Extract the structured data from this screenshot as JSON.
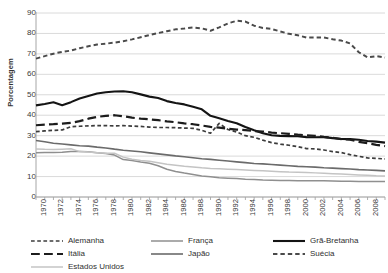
{
  "chart_data": {
    "type": "line",
    "title": "",
    "xlabel": "",
    "ylabel": "Porcentagem",
    "ylim": [
      0,
      90
    ],
    "ytick_step": 10,
    "yticks": [
      0,
      10,
      20,
      30,
      40,
      50,
      60,
      70,
      80,
      90
    ],
    "xlim": [
      1970,
      2010
    ],
    "x": [
      1970,
      1971,
      1972,
      1973,
      1974,
      1975,
      1976,
      1977,
      1978,
      1979,
      1980,
      1981,
      1982,
      1983,
      1984,
      1985,
      1986,
      1987,
      1988,
      1989,
      1990,
      1991,
      1992,
      1993,
      1994,
      1995,
      1996,
      1997,
      1998,
      1999,
      2000,
      2001,
      2002,
      2003,
      2004,
      2005,
      2006,
      2007,
      2008,
      2009,
      2010
    ],
    "xtick_labels": [
      "1970",
      "1972",
      "1974",
      "1976",
      "1978",
      "1980",
      "1982",
      "1984",
      "1986",
      "1988",
      "1990",
      "1992",
      "1994",
      "1996",
      "1998",
      "2000",
      "2002",
      "2004",
      "2006",
      "2008",
      "2010"
    ],
    "grid": "horizontal",
    "legend_position": "bottom",
    "series": [
      {
        "name": "Alemanha",
        "color": "#3c3c3c",
        "style": "dashed",
        "width": 1.7,
        "values": [
          32.0,
          32.3,
          32.6,
          32.8,
          34.4,
          34.6,
          34.8,
          34.9,
          34.9,
          34.8,
          34.9,
          34.7,
          34.5,
          34.2,
          34.0,
          34.0,
          33.9,
          33.7,
          33.6,
          32.6,
          31.2,
          36.0,
          33.0,
          31.8,
          30.0,
          29.2,
          27.8,
          26.6,
          25.9,
          25.3,
          24.6,
          23.7,
          23.5,
          23.0,
          22.2,
          21.7,
          20.7,
          19.9,
          19.1,
          18.9,
          18.6
        ]
      },
      {
        "name": "França",
        "color": "#8f8f8f",
        "style": "solid",
        "width": 1.5,
        "values": [
          21.7,
          21.8,
          21.8,
          21.9,
          22.2,
          22.2,
          22.1,
          21.7,
          21.3,
          20.5,
          18.3,
          17.8,
          17.1,
          16.5,
          15.3,
          13.6,
          12.5,
          11.7,
          11.0,
          10.3,
          9.9,
          9.4,
          9.2,
          9.0,
          8.7,
          8.5,
          8.3,
          8.2,
          8.1,
          8.1,
          8.0,
          8.0,
          8.0,
          7.9,
          7.8,
          7.7,
          7.7,
          7.6,
          7.6,
          7.6,
          7.6
        ]
      },
      {
        "name": "Grã-Bretanha",
        "color": "#141414",
        "style": "solid",
        "width": 2.1,
        "values": [
          44.8,
          45.5,
          46.3,
          44.9,
          46.4,
          48.2,
          49.4,
          50.6,
          51.2,
          51.6,
          51.7,
          51.2,
          50.2,
          49.1,
          48.4,
          46.9,
          46.0,
          45.3,
          44.1,
          42.9,
          39.7,
          38.5,
          37.2,
          36.1,
          34.2,
          32.6,
          31.2,
          30.2,
          29.9,
          29.8,
          29.7,
          29.3,
          29.2,
          29.3,
          28.8,
          28.4,
          28.3,
          28.0,
          27.4,
          27.1,
          26.6
        ]
      },
      {
        "name": "Itália",
        "color": "#1c1c1c",
        "style": "long-dash",
        "width": 2.2,
        "values": [
          35.1,
          35.4,
          35.6,
          35.9,
          36.3,
          37.1,
          38.3,
          39.2,
          39.7,
          40.0,
          39.5,
          38.8,
          38.3,
          38.0,
          37.6,
          37.0,
          36.6,
          36.0,
          35.6,
          35.0,
          34.3,
          33.9,
          33.4,
          33.0,
          32.7,
          32.3,
          32.0,
          31.5,
          31.2,
          30.9,
          30.5,
          30.2,
          29.9,
          29.4,
          29.0,
          28.3,
          28.0,
          27.0,
          26.3,
          25.5,
          24.9
        ]
      },
      {
        "name": "Japão",
        "color": "#6b6b6b",
        "style": "solid",
        "width": 1.6,
        "values": [
          27.6,
          27.0,
          26.3,
          25.9,
          25.5,
          25.1,
          24.9,
          24.4,
          24.0,
          23.4,
          22.9,
          22.5,
          22.1,
          21.6,
          21.1,
          20.6,
          20.1,
          19.7,
          19.2,
          18.7,
          18.4,
          18.0,
          17.6,
          17.2,
          16.8,
          16.4,
          16.2,
          15.9,
          15.6,
          15.3,
          15.0,
          14.8,
          14.6,
          14.3,
          14.1,
          13.9,
          13.7,
          13.4,
          13.2,
          13.0,
          12.8
        ]
      },
      {
        "name": "Estados Unidos",
        "color": "#c4c4c4",
        "style": "solid",
        "width": 1.5,
        "values": [
          23.5,
          23.3,
          23.2,
          23.4,
          23.6,
          22.2,
          22.0,
          21.7,
          21.4,
          21.4,
          19.5,
          18.5,
          17.9,
          17.5,
          16.8,
          16.0,
          15.5,
          15.0,
          14.7,
          14.3,
          14.0,
          13.8,
          13.6,
          13.4,
          13.2,
          13.0,
          12.8,
          12.6,
          12.4,
          12.2,
          12.1,
          12.0,
          11.8,
          11.6,
          11.4,
          11.2,
          11.0,
          10.8,
          10.6,
          10.4,
          10.3
        ]
      },
      {
        "name": "Suécia",
        "color": "#4a4a4a",
        "style": "dashed",
        "width": 2.0,
        "values": [
          67.7,
          68.9,
          70.1,
          71.0,
          71.6,
          72.8,
          73.7,
          74.6,
          75.0,
          75.5,
          76.2,
          77.1,
          78.1,
          79.2,
          80.2,
          81.1,
          82.0,
          82.4,
          82.9,
          82.5,
          81.3,
          83.0,
          84.9,
          86.2,
          85.8,
          83.8,
          82.7,
          82.2,
          81.0,
          79.8,
          79.1,
          78.0,
          78.0,
          78.0,
          77.2,
          76.5,
          75.1,
          70.8,
          68.3,
          68.9,
          68.2
        ]
      }
    ]
  },
  "legend": {
    "items": [
      {
        "label": "Alemanha",
        "series": 0,
        "col": 0,
        "row": 0
      },
      {
        "label": "Itália",
        "series": 3,
        "col": 0,
        "row": 1
      },
      {
        "label": "Estados Unidos",
        "series": 5,
        "col": 0,
        "row": 2
      },
      {
        "label": "França",
        "series": 1,
        "col": 1,
        "row": 0
      },
      {
        "label": "Japão",
        "series": 4,
        "col": 1,
        "row": 1
      },
      {
        "label": "Grã-Bretanha",
        "series": 2,
        "col": 2,
        "row": 0
      },
      {
        "label": "Suécia",
        "series": 6,
        "col": 2,
        "row": 1
      }
    ]
  },
  "axis": {
    "line_color": "#a6a6a6",
    "grid_color": "#d0d0d0"
  }
}
